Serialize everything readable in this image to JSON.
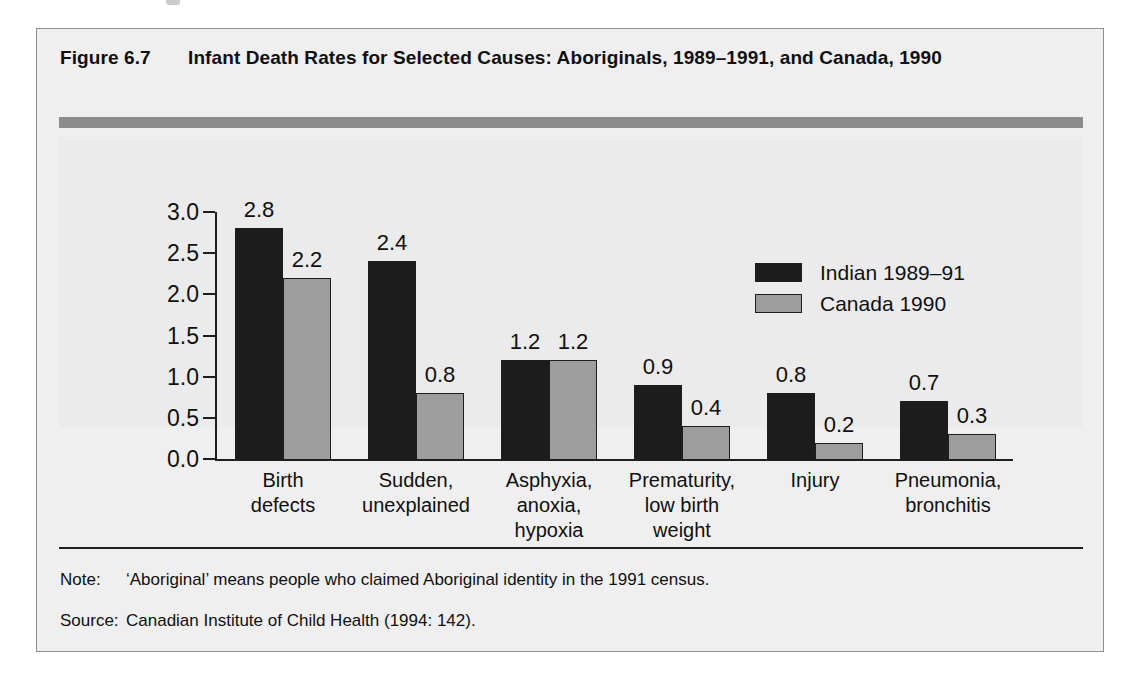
{
  "figure": {
    "label": "Figure 6.7",
    "title": "Infant Death Rates for Selected Causes: Aboriginals, 1989–1991, and Canada, 1990"
  },
  "notes": [
    {
      "key": "Note:",
      "text": "‘Aboriginal’ means people who claimed Aboriginal identity in the 1991 census."
    },
    {
      "key": "Source:",
      "text": "Canadian Institute of Child Health (1994: 142)."
    }
  ],
  "colors": {
    "series_indian": "#1c1c1c",
    "series_canada": "#9d9d9d",
    "header_rule": "#8c8c8c",
    "axis": "#1e1e1e",
    "plot_background": "#ebebeb",
    "figure_background": "#efefef"
  },
  "chart_data": {
    "type": "bar",
    "title": "Infant Death Rates for Selected Causes: Aboriginals, 1989–1991, and Canada, 1990",
    "xlabel": "",
    "ylabel": "",
    "ylim": [
      0.0,
      3.0
    ],
    "ytick_labels": [
      "3.0",
      "2.5",
      "2.0",
      "1.5",
      "1.0",
      "0.5",
      "0.0"
    ],
    "ytick_values": [
      3.0,
      2.5,
      2.0,
      1.5,
      1.0,
      0.5,
      0.0
    ],
    "grid": false,
    "legend_position": "upper-right-inside",
    "categories": [
      "Birth\ndefects",
      "Sudden,\nunexplained",
      "Asphyxia,\nanoxia,\nhypoxia",
      "Prematurity,\nlow birth\nweight",
      "Injury",
      "Pneumonia,\nbronchitis"
    ],
    "category_lines": [
      [
        "Birth",
        "defects"
      ],
      [
        "Sudden,",
        "unexplained"
      ],
      [
        "Asphyxia,",
        "anoxia,",
        "hypoxia"
      ],
      [
        "Prematurity,",
        "low birth",
        "weight"
      ],
      [
        "Injury"
      ],
      [
        "Pneumonia,",
        "bronchitis"
      ]
    ],
    "series": [
      {
        "name": "Indian 1989–91",
        "color": "#1c1c1c",
        "values": [
          2.8,
          2.4,
          1.2,
          0.9,
          0.8,
          0.7
        ],
        "labels": [
          "2.8",
          "2.4",
          "1.2",
          "0.9",
          "0.8",
          "0.7"
        ]
      },
      {
        "name": "Canada 1990",
        "color": "#9d9d9d",
        "values": [
          2.2,
          0.8,
          1.2,
          0.4,
          0.2,
          0.3
        ],
        "labels": [
          "2.2",
          "0.8",
          "1.2",
          "0.4",
          "0.2",
          "0.3"
        ]
      }
    ]
  }
}
